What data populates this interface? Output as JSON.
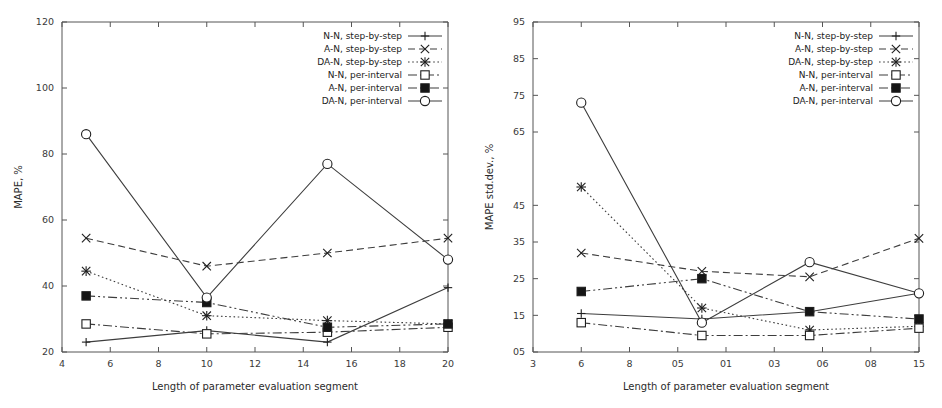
{
  "figure": {
    "panels": [
      {
        "name": "mape-panel",
        "chart_data": {
          "type": "line",
          "title": "",
          "xlabel": "Length of parameter evaluation segment",
          "ylabel": "MAPE, %",
          "xlim": [
            4,
            20
          ],
          "ylim": [
            20,
            120
          ],
          "xticks": [
            4,
            6,
            8,
            10,
            12,
            14,
            16,
            18,
            20
          ],
          "xtick_labels": [
            "4",
            "6",
            "8",
            "10",
            "12",
            "14",
            "16",
            "18",
            "20"
          ],
          "yticks": [
            20,
            40,
            60,
            80,
            100,
            120
          ],
          "ytick_labels": [
            "20",
            "40",
            "60",
            "80",
            "100",
            "120"
          ],
          "grid": false,
          "legend_position": "top-right",
          "x": [
            5,
            10,
            15,
            20
          ],
          "series": [
            {
              "name": "N-N, step-by-step",
              "marker": "plus",
              "line_style": "solid",
              "values": [
                23,
                26.5,
                23,
                39.5
              ]
            },
            {
              "name": "A-N, step-by-step",
              "marker": "cross",
              "line_style": "dashed",
              "values": [
                54.5,
                46,
                50,
                54.5
              ]
            },
            {
              "name": "DA-N, step-by-step",
              "marker": "asterisk",
              "line_style": "dotted",
              "values": [
                44.5,
                31,
                29.5,
                28.5
              ]
            },
            {
              "name": "N-N, per-interval",
              "marker": "open-square",
              "line_style": "dashdot",
              "values": [
                28.5,
                25.5,
                26,
                27.5
              ]
            },
            {
              "name": "A-N, per-interval",
              "marker": "filled-square",
              "line_style": "dashdotdot",
              "values": [
                37,
                35,
                27.5,
                28.5
              ]
            },
            {
              "name": "DA-N, per-interval",
              "marker": "open-circle",
              "line_style": "solid",
              "values": [
                86,
                36.5,
                77,
                48
              ]
            }
          ]
        }
      },
      {
        "name": "mape-stddev-panel",
        "chart_data": {
          "type": "line",
          "title": "",
          "xlabel": "Length of parameter evaluation segment",
          "ylabel": "MAPE std.dev., %",
          "xlim": [
            3,
            15
          ],
          "ylim": [
            5,
            95
          ],
          "xticks": [
            3,
            6,
            8,
            10,
            12,
            14,
            16,
            18,
            15
          ],
          "xtick_labels": [
            "3",
            "6",
            "8",
            "05",
            "01",
            "03",
            "06",
            "08",
            "15"
          ],
          "yticks": [
            5,
            15,
            25,
            35,
            45,
            65,
            75,
            85,
            95
          ],
          "ytick_labels": [
            "05",
            "15",
            "25",
            "35",
            "45",
            "65",
            "75",
            "85",
            "95"
          ],
          "grid": false,
          "legend_position": "top-right",
          "x": [
            4.5,
            8.25,
            11.6,
            15
          ],
          "series": [
            {
              "name": "N-N, step-by-step",
              "marker": "plus",
              "line_style": "solid",
              "values": [
                15.5,
                14,
                16,
                21
              ]
            },
            {
              "name": "A-N, step-by-step",
              "marker": "cross",
              "line_style": "dashed",
              "values": [
                32,
                27,
                25.5,
                36
              ]
            },
            {
              "name": "DA-N, step-by-step",
              "marker": "asterisk",
              "line_style": "dotted",
              "values": [
                50,
                17,
                11,
                12
              ]
            },
            {
              "name": "N-N, per-interval",
              "marker": "open-square",
              "line_style": "dashdot",
              "values": [
                13,
                9.5,
                9.5,
                11.5
              ]
            },
            {
              "name": "A-N, per-interval",
              "marker": "filled-square",
              "line_style": "dashdotdot",
              "values": [
                21.5,
                25,
                16,
                14
              ]
            },
            {
              "name": "DA-N, per-interval",
              "marker": "open-circle",
              "line_style": "solid",
              "values": [
                73,
                13,
                29.5,
                21
              ]
            }
          ]
        }
      }
    ]
  }
}
